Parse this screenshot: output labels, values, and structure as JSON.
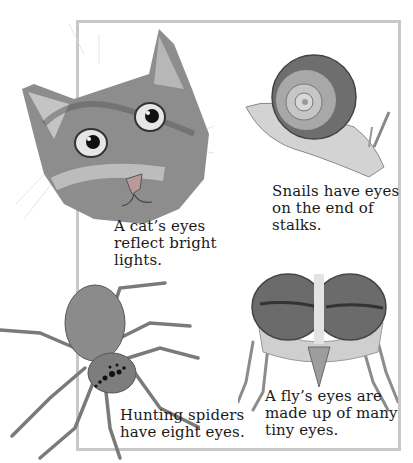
{
  "captions": {
    "cat": "A cat’s eyes\nreflect bright\nlights.",
    "snail": "Snails have eyes\non the end of\nstalks.",
    "spider": "Hunting spiders\nhave eight eyes.",
    "fly": "A fly’s eyes are\nmade up of many\ntiny eyes."
  },
  "illustrations": [
    "cat-head",
    "snail",
    "hunting-spider",
    "fly-head"
  ],
  "colors": {
    "frame": "#c8c8c8",
    "text": "#1a1a1a",
    "background": "#ffffff"
  }
}
